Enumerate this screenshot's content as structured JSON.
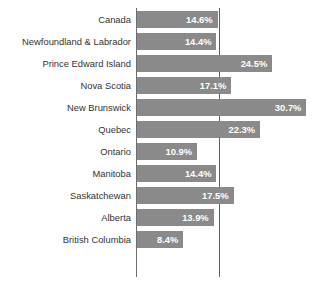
{
  "chart_data": {
    "type": "bar",
    "orientation": "horizontal",
    "title": "",
    "xlabel": "",
    "ylabel": "",
    "xlim": [
      0,
      34
    ],
    "grid": false,
    "legend": null,
    "reference_line": 15.0,
    "value_suffix": "%",
    "bar_color": "#8a8a8a",
    "value_label_color": "#ffffff",
    "category_label_color": "#333333",
    "axis_color": "#6d6d6d",
    "categories": [
      "Canada",
      "Newfoundland & Labrador",
      "Prince Edward Island",
      "Nova Scotia",
      "New Brunswick",
      "Quebec",
      "Ontario",
      "Manitoba",
      "Saskatchewan",
      "Alberta",
      "British Columbia"
    ],
    "values": [
      14.6,
      14.4,
      24.5,
      17.1,
      30.7,
      22.3,
      10.9,
      14.4,
      17.5,
      13.9,
      8.4
    ],
    "value_labels": [
      "14.6%",
      "14.4%",
      "24.5%",
      "17.1%",
      "30.7%",
      "22.3%",
      "10.9%",
      "14.4%",
      "17.5%",
      "13.9%",
      "8.4%"
    ]
  }
}
